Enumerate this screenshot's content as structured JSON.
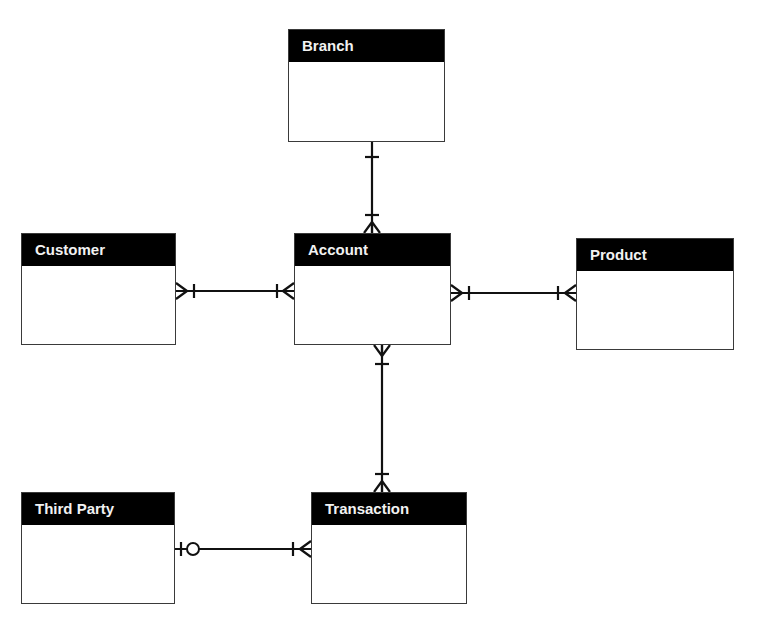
{
  "diagram": {
    "type": "entity-relationship",
    "notation": "crows-foot",
    "entities": [
      {
        "id": "branch",
        "label": "Branch"
      },
      {
        "id": "customer",
        "label": "Customer"
      },
      {
        "id": "account",
        "label": "Account"
      },
      {
        "id": "product",
        "label": "Product"
      },
      {
        "id": "third_party",
        "label": "Third Party"
      },
      {
        "id": "transaction",
        "label": "Transaction"
      }
    ],
    "relationships": [
      {
        "from": "Branch",
        "from_cardinality": "one",
        "to": "Account",
        "to_cardinality": "one-or-many"
      },
      {
        "from": "Customer",
        "from_cardinality": "one-or-many",
        "to": "Account",
        "to_cardinality": "one-or-many"
      },
      {
        "from": "Account",
        "from_cardinality": "one-or-many",
        "to": "Product",
        "to_cardinality": "one-or-many"
      },
      {
        "from": "Account",
        "from_cardinality": "one-or-many",
        "to": "Transaction",
        "to_cardinality": "one-or-many"
      },
      {
        "from": "Third Party",
        "from_cardinality": "zero-or-one",
        "to": "Transaction",
        "to_cardinality": "one-or-many"
      }
    ]
  }
}
